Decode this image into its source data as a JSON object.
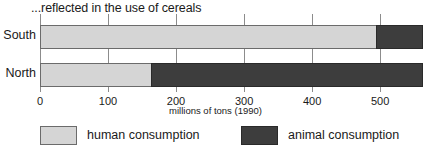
{
  "chart_data": {
    "type": "bar",
    "orientation": "horizontal",
    "stacked": true,
    "title": "...reflected in the use of cereals",
    "xlabel": "millions of tons (1990)",
    "ylabel": "",
    "categories": [
      "South",
      "North"
    ],
    "series": [
      {
        "name": "human consumption",
        "color": "#d5d5d5",
        "values": [
          495,
          165
        ]
      },
      {
        "name": "animal consumption",
        "color": "#3d3d3d",
        "values": [
          68,
          398
        ]
      }
    ],
    "totals": [
      563,
      563
    ],
    "xlim": [
      0,
      563
    ],
    "xticks": [
      0,
      100,
      200,
      300,
      400,
      500
    ],
    "xtick_labels": [
      "0",
      "100",
      "200",
      "300",
      "400",
      "500"
    ],
    "grid": true,
    "grid_axis": "x",
    "legend_position": "bottom"
  },
  "legend": {
    "items": [
      {
        "label": "human consumption",
        "color": "#d5d5d5"
      },
      {
        "label": "animal consumption",
        "color": "#3d3d3d"
      }
    ]
  },
  "colors": {
    "human": "#d5d5d5",
    "animal": "#3d3d3d",
    "gridline": "#8c8c8c",
    "bar_border": "#6b6b6b",
    "text": "#1a1a1a",
    "background": "#ffffff"
  }
}
